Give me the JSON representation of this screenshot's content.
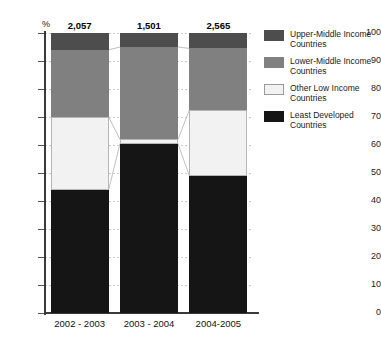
{
  "chart_data": {
    "type": "bar",
    "subtype": "100% stacked bar",
    "title": "",
    "xlabel": "",
    "ylabel": "%",
    "ylim": [
      0,
      100
    ],
    "ytick_labels": [
      "100",
      "90",
      "80",
      "70",
      "60",
      "50",
      "40",
      "30",
      "20",
      "10",
      "0"
    ],
    "ytick_values": [
      100,
      90,
      80,
      70,
      60,
      50,
      40,
      30,
      20,
      10,
      0
    ],
    "grid": true,
    "legend_position": "right",
    "categories": [
      "2002 - 2003",
      "2003 - 2004",
      "2004-2005"
    ],
    "bar_totals": [
      "2,057",
      "1,501",
      "2,565"
    ],
    "series": [
      {
        "name": "Least Developed Countries",
        "color": "#151515",
        "values": [
          44.0,
          60.5,
          49.0
        ]
      },
      {
        "name": "Other Low Income Countries",
        "color": "#f2f2f2",
        "values": [
          26.0,
          1.5,
          23.5
        ]
      },
      {
        "name": "Lower-Middle Income Countries",
        "color": "#808080",
        "values": [
          24.0,
          33.0,
          22.0
        ]
      },
      {
        "name": "Upper-Middle Income Countries",
        "color": "#4d4d4d",
        "values": [
          6.0,
          5.0,
          5.5
        ]
      }
    ]
  },
  "axis": {
    "percent_symbol": "%",
    "ticks": [
      {
        "label": "100"
      },
      {
        "label": "90"
      },
      {
        "label": "80"
      },
      {
        "label": "70"
      },
      {
        "label": "60"
      },
      {
        "label": "50"
      },
      {
        "label": "40"
      },
      {
        "label": "30"
      },
      {
        "label": "20"
      },
      {
        "label": "10"
      },
      {
        "label": "0"
      }
    ]
  },
  "bars": [
    {
      "category": "2002 - 2003",
      "total": "2,057"
    },
    {
      "category": "2003 - 2004",
      "total": "1,501"
    },
    {
      "category": "2004-2005",
      "total": "2,565"
    }
  ],
  "legend": {
    "items": [
      {
        "label": "Upper-Middle Income Countries",
        "color": "#4d4d4d",
        "swatch": "upper-middle-swatch"
      },
      {
        "label": "Lower-Middle Income Countries",
        "color": "#808080",
        "swatch": "lower-middle-swatch"
      },
      {
        "label": "Other Low Income Countries",
        "color": "#f2f2f2",
        "swatch": "other-low-swatch"
      },
      {
        "label": "Least Developed Countries",
        "color": "#151515",
        "swatch": "least-developed-swatch"
      }
    ]
  }
}
